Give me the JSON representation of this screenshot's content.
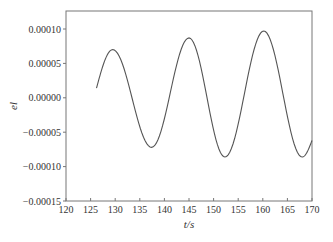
{
  "chart_data": {
    "type": "line",
    "title": "",
    "xlabel": "t/s",
    "ylabel": "el",
    "xlim": [
      120,
      170
    ],
    "ylim": [
      -0.00015,
      0.000125
    ],
    "grid": false,
    "legend": null,
    "xticks": [
      120,
      125,
      130,
      135,
      140,
      145,
      150,
      155,
      160,
      165,
      170
    ],
    "xtick_labels": [
      "120",
      "125",
      "130",
      "135",
      "140",
      "145",
      "150",
      "155",
      "160",
      "165",
      "170"
    ],
    "yticks": [
      0.0001,
      5e-05,
      0.0,
      -5e-05,
      -0.0001,
      -0.00015
    ],
    "ytick_labels": [
      "0.00010",
      "0.00005",
      "0.00000",
      "−0.00005",
      "−0.00010",
      "−0.00015"
    ],
    "series": [
      {
        "name": "el",
        "color": "#555555",
        "key_points": [
          {
            "t": 126.2,
            "v": 1.4e-05
          },
          {
            "t": 129.5,
            "v": 7e-05
          },
          {
            "t": 137.4,
            "v": -7.2e-05
          },
          {
            "t": 145.0,
            "v": 8.7e-05
          },
          {
            "t": 152.3,
            "v": -8.6e-05
          },
          {
            "t": 160.2,
            "v": 9.7e-05
          },
          {
            "t": 168.0,
            "v": -8.6e-05
          },
          {
            "t": 170.0,
            "v": -6.2e-05
          }
        ]
      }
    ]
  }
}
